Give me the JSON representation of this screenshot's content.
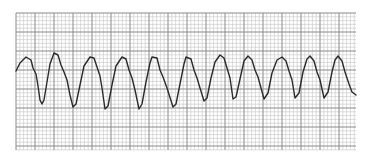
{
  "strip": {
    "type": "ecg-rhythm-strip",
    "rhythm_description": "regular sinusoidal wide-complex waveform",
    "grid": {
      "left": 16,
      "top": 13,
      "right": 356,
      "bottom": 150,
      "small_square_px": 3.8,
      "large_every": 5,
      "minor_color": "#c4c4c4",
      "major_color": "#8a8a8a"
    },
    "trace": {
      "color": "#2a2a2a",
      "width": 1.4,
      "points": [
        [
          16,
          71
        ],
        [
          20,
          63
        ],
        [
          26,
          57
        ],
        [
          31,
          60
        ],
        [
          33,
          68
        ],
        [
          36,
          74
        ],
        [
          38,
          86
        ],
        [
          40,
          100
        ],
        [
          42,
          104
        ],
        [
          44,
          100
        ],
        [
          47,
          82
        ],
        [
          50,
          64
        ],
        [
          54,
          53
        ],
        [
          58,
          55
        ],
        [
          61,
          65
        ],
        [
          64,
          72
        ],
        [
          67,
          80
        ],
        [
          70,
          95
        ],
        [
          73,
          107
        ],
        [
          76,
          104
        ],
        [
          80,
          85
        ],
        [
          84,
          66
        ],
        [
          90,
          57
        ],
        [
          94,
          58
        ],
        [
          97,
          67
        ],
        [
          100,
          76
        ],
        [
          102,
          88
        ],
        [
          105,
          109
        ],
        [
          108,
          106
        ],
        [
          112,
          85
        ],
        [
          116,
          66
        ],
        [
          122,
          57
        ],
        [
          126,
          59
        ],
        [
          129,
          70
        ],
        [
          132,
          78
        ],
        [
          135,
          90
        ],
        [
          139,
          109
        ],
        [
          142,
          104
        ],
        [
          146,
          82
        ],
        [
          150,
          63
        ],
        [
          152,
          57
        ],
        [
          157,
          58
        ],
        [
          160,
          70
        ],
        [
          163,
          77
        ],
        [
          167,
          88
        ],
        [
          173,
          107
        ],
        [
          176,
          104
        ],
        [
          180,
          84
        ],
        [
          184,
          64
        ],
        [
          186,
          57
        ],
        [
          191,
          59
        ],
        [
          194,
          70
        ],
        [
          197,
          78
        ],
        [
          200,
          88
        ],
        [
          204,
          101
        ],
        [
          207,
          98
        ],
        [
          211,
          78
        ],
        [
          215,
          62
        ],
        [
          220,
          55
        ],
        [
          224,
          58
        ],
        [
          227,
          68
        ],
        [
          230,
          78
        ],
        [
          233,
          99
        ],
        [
          236,
          97
        ],
        [
          240,
          79
        ],
        [
          244,
          61
        ],
        [
          248,
          56
        ],
        [
          252,
          60
        ],
        [
          255,
          70
        ],
        [
          258,
          77
        ],
        [
          261,
          88
        ],
        [
          264,
          99
        ],
        [
          268,
          93
        ],
        [
          272,
          73
        ],
        [
          277,
          60
        ],
        [
          282,
          57
        ],
        [
          286,
          61
        ],
        [
          289,
          71
        ],
        [
          292,
          80
        ],
        [
          295,
          98
        ],
        [
          299,
          93
        ],
        [
          303,
          72
        ],
        [
          307,
          59
        ],
        [
          310,
          56
        ],
        [
          314,
          61
        ],
        [
          317,
          72
        ],
        [
          320,
          80
        ],
        [
          324,
          98
        ],
        [
          328,
          92
        ],
        [
          332,
          72
        ],
        [
          335,
          60
        ],
        [
          338,
          56
        ],
        [
          342,
          61
        ],
        [
          345,
          72
        ],
        [
          349,
          84
        ],
        [
          352,
          92
        ],
        [
          356,
          95
        ]
      ]
    }
  }
}
